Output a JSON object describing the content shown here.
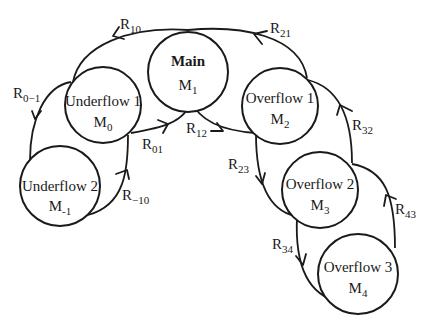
{
  "diagram": {
    "type": "state-transition",
    "nodes": [
      {
        "id": "M1",
        "name": "Main",
        "symbol": "M",
        "sub": "1",
        "bold": true,
        "cx": 188,
        "cy": 72,
        "r": 40
      },
      {
        "id": "M0",
        "name": "Underflow 1",
        "symbol": "M",
        "sub": "0",
        "bold": false,
        "cx": 103,
        "cy": 105,
        "r": 38
      },
      {
        "id": "M2",
        "name": "Overflow 1",
        "symbol": "M",
        "sub": "2",
        "bold": false,
        "cx": 280,
        "cy": 106,
        "r": 38
      },
      {
        "id": "M-1",
        "name": "Underflow 2",
        "symbol": "M",
        "sub": "-1",
        "bold": false,
        "cx": 60,
        "cy": 186,
        "r": 40
      },
      {
        "id": "M3",
        "name": "Overflow 2",
        "symbol": "M",
        "sub": "3",
        "bold": false,
        "cx": 320,
        "cy": 190,
        "r": 38
      },
      {
        "id": "M4",
        "name": "Overflow 3",
        "symbol": "M",
        "sub": "4",
        "bold": false,
        "cx": 358,
        "cy": 274,
        "r": 40
      }
    ],
    "edges": [
      {
        "id": "R10",
        "label": "R",
        "sub": "10",
        "from": "M1",
        "to": "M0"
      },
      {
        "id": "R21",
        "label": "R",
        "sub": "21",
        "from": "M2",
        "to": "M1"
      },
      {
        "id": "R0-1",
        "label": "R",
        "sub": "0−1",
        "from": "M0",
        "to": "M-1"
      },
      {
        "id": "R01",
        "label": "R",
        "sub": "01",
        "from": "M0",
        "to": "M1"
      },
      {
        "id": "R12",
        "label": "R",
        "sub": "12",
        "from": "M1",
        "to": "M2"
      },
      {
        "id": "R-10",
        "label": "R",
        "sub": "−10",
        "from": "M-1",
        "to": "M0"
      },
      {
        "id": "R32",
        "label": "R",
        "sub": "32",
        "from": "M3",
        "to": "M2"
      },
      {
        "id": "R23",
        "label": "R",
        "sub": "23",
        "from": "M2",
        "to": "M3"
      },
      {
        "id": "R43",
        "label": "R",
        "sub": "43",
        "from": "M4",
        "to": "M3"
      },
      {
        "id": "R34",
        "label": "R",
        "sub": "34",
        "from": "M3",
        "to": "M4"
      }
    ]
  }
}
